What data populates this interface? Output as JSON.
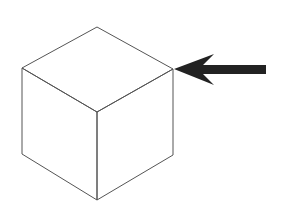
{
  "diagram": {
    "colors": {
      "background": "#ffffff",
      "cube_stroke": "#555555",
      "arrow_fill": "#222222"
    },
    "cube": {
      "vertices": {
        "top": [
          97,
          27
        ],
        "left_top": [
          22,
          68
        ],
        "right_top": [
          173,
          69
        ],
        "front_middle": [
          97,
          112
        ],
        "left_bottom": [
          22,
          154
        ],
        "right_bottom": [
          173,
          155
        ],
        "bottom": [
          97,
          200
        ]
      }
    },
    "arrow": {
      "points_to": "right_top",
      "tip": [
        174,
        69
      ]
    }
  }
}
